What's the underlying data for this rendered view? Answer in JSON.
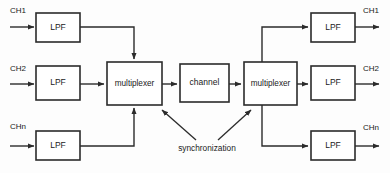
{
  "diagram": {
    "type": "block-diagram",
    "canvas": {
      "width": 390,
      "height": 173
    },
    "colors": {
      "background": "#fdfdfd",
      "stroke": "#2b2b2b",
      "block_fill": "#ffffff",
      "text": "#1a1a1a"
    },
    "transmit": {
      "inputs": [
        {
          "id": "ch1",
          "label": "CH1",
          "filter_label": "LPF"
        },
        {
          "id": "ch2",
          "label": "CH2",
          "filter_label": "LPF"
        },
        {
          "id": "chn",
          "label": "CHn",
          "filter_label": "LPF"
        }
      ],
      "multiplexer_label": "multiplexer"
    },
    "channel": {
      "label": "channel"
    },
    "receive": {
      "multiplexer_label": "multiplexer",
      "outputs": [
        {
          "id": "ch1",
          "label": "CH1",
          "filter_label": "LPF"
        },
        {
          "id": "ch2",
          "label": "CH2",
          "filter_label": "LPF"
        },
        {
          "id": "chn",
          "label": "CHn",
          "filter_label": "LPF"
        }
      ]
    },
    "annotation": {
      "sync_label": "synchronization"
    }
  }
}
